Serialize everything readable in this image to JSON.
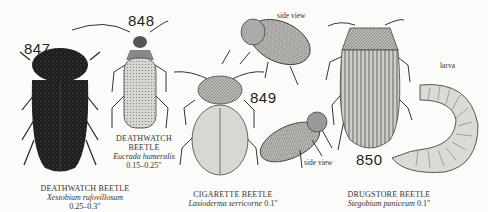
{
  "plate": {
    "figures": [
      {
        "number": "847",
        "common_name": "DEATHWATCH BEETLE",
        "scientific_name": "Xestobium rufovillosum",
        "size": "0.25–0.3\""
      },
      {
        "number": "848",
        "common_name_line1": "DEATHWATCH",
        "common_name_line2": "BEETLE",
        "scientific_name": "Eucrada humeralis",
        "size": "0.15–0.25\""
      },
      {
        "number": "849",
        "common_name": "CIGARETTE BEETLE",
        "scientific_name": "Lasioderma serricorne",
        "size": "0.1\"",
        "notes": [
          "side view",
          "side view"
        ]
      },
      {
        "number": "850",
        "common_name": "DRUGSTORE BEETLE",
        "scientific_name": "Stegobium paniceum",
        "size": "0.1\"",
        "notes": [
          "larva"
        ]
      }
    ]
  }
}
